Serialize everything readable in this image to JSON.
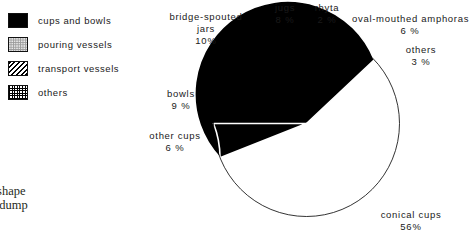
{
  "legend": {
    "items": [
      {
        "label": "cups and bowls",
        "pattern": "solid",
        "swatch_name": "legend-swatch-cups-and-bowls"
      },
      {
        "label": "pouring vessels",
        "pattern": "dots",
        "swatch_name": "legend-swatch-pouring-vessels"
      },
      {
        "label": "transport vessels",
        "pattern": "hatch",
        "swatch_name": "legend-swatch-transport-vessels"
      },
      {
        "label": "others",
        "pattern": "check",
        "swatch_name": "legend-swatch-others"
      }
    ]
  },
  "caption": {
    "line1": "ase shape",
    "line2": "and dump"
  },
  "chart_data": {
    "type": "pie",
    "title": "",
    "legend_position": "top-left",
    "total": 100,
    "units": "%",
    "categories": [
      "bowls",
      "bridge-spouted jars",
      "jugs",
      "rhyta",
      "oval-mouthed amphoras",
      "others",
      "conical cups",
      "other cups"
    ],
    "values": [
      9,
      10,
      8,
      2,
      6,
      3,
      56,
      6
    ],
    "slices": [
      {
        "label": "bowls",
        "value": 9,
        "display": "9 %",
        "group": "cups and bowls",
        "pattern": "solid"
      },
      {
        "label": "bridge-spouted jars",
        "value": 10,
        "display": "10 %",
        "group": "pouring vessels",
        "pattern": "dots"
      },
      {
        "label": "jugs",
        "value": 8,
        "display": "8 %",
        "group": "pouring vessels",
        "pattern": "dots"
      },
      {
        "label": "rhyta",
        "value": 2,
        "display": "2 %",
        "group": "others",
        "pattern": "check"
      },
      {
        "label": "oval-mouthed amphoras",
        "value": 6,
        "display": "6 %",
        "group": "transport vessels",
        "pattern": "hatch"
      },
      {
        "label": "others",
        "value": 3,
        "display": "3 %",
        "group": "others",
        "pattern": "check"
      },
      {
        "label": "conical cups",
        "value": 56,
        "display": "56%",
        "group": "cups and bowls",
        "pattern": "solid"
      },
      {
        "label": "other cups",
        "value": 6,
        "display": "6 %",
        "group": "cups and bowls",
        "pattern": "solid"
      }
    ]
  },
  "labels": {
    "bridge_spouted_jars": {
      "name_line1": "bridge-spouted",
      "name_line2": "jars",
      "pct": "10%"
    },
    "jugs": {
      "name": "jugs",
      "pct": "8 %"
    },
    "rhyta": {
      "name": "rhyta",
      "pct": "2 %"
    },
    "oval_mouthed_amphoras": {
      "name": "oval-mouthed  amphoras",
      "pct": "6 %"
    },
    "others": {
      "name": "others",
      "pct": "3 %"
    },
    "bowls": {
      "name": "bowls",
      "pct": "9 %"
    },
    "other_cups": {
      "name": "other  cups",
      "pct": "6 %"
    },
    "conical_cups": {
      "name": "conical  cups",
      "pct": "56%"
    }
  },
  "colors": {
    "solid": "#000000",
    "dots": "#9a9a9a",
    "background": "#ffffff",
    "separator": "#ffffff",
    "text": "#1a1a1a"
  }
}
